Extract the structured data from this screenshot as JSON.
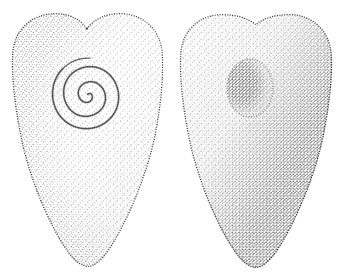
{
  "plate": {
    "title": "Stippled engraving of two heart-shaped stone artifacts",
    "background_color": "#ffffff",
    "ink_color": "#1a1a1a",
    "width": 346,
    "height": 280,
    "caption": "",
    "style": "stipple / dot-engraving",
    "figure_count": 2
  },
  "figures": [
    {
      "id": "left",
      "name": "obverse-face",
      "label": "",
      "shape": "heart-shield",
      "bounds": {
        "x": 12,
        "y": 14,
        "width": 151,
        "height": 252
      },
      "top_notch": "deep-v",
      "ornament": {
        "name": "carved-spiral",
        "type": "spiral",
        "center_x": 87,
        "center_y": 95,
        "turns": 3,
        "outer_radius": 26
      },
      "shading_side": "right",
      "interior_tone": "light"
    },
    {
      "id": "right",
      "name": "reverse-face",
      "label": "",
      "shape": "heart-shield",
      "bounds": {
        "x": 180,
        "y": 14,
        "width": 153,
        "height": 252
      },
      "top_notch": "shallow-v",
      "ornament": {
        "name": "pecked-hollow",
        "type": "oval-depression",
        "center_x": 250,
        "center_y": 88,
        "radius_x": 21,
        "radius_y": 27,
        "turns": 0,
        "outer_radius": 27
      },
      "shading_side": "right",
      "interior_tone": "light"
    }
  ]
}
